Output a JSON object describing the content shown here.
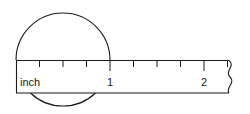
{
  "figure": {
    "background_color": "#ffffff",
    "line_color": "#1a1a1a",
    "width": 250,
    "height": 114
  },
  "ruler": {
    "unit_label": "inch",
    "left_x": 16,
    "top_y": 60,
    "bottom_y": 93,
    "right_x": 232,
    "pixels_per_inch": 47,
    "broken_edge": true,
    "broken_edge_name": "break-squiggle",
    "major_ticks": [
      {
        "value": "0",
        "label": "",
        "x": 16,
        "height": 11
      },
      {
        "value": "1",
        "label": "1",
        "x": 110,
        "height": 11
      },
      {
        "value": "2",
        "label": "2",
        "x": 204,
        "height": 11
      }
    ],
    "minor_ticks": [
      {
        "value": "0.25",
        "x": 39.5,
        "height": 6
      },
      {
        "value": "0.5",
        "x": 63,
        "height": 6
      },
      {
        "value": "0.75",
        "x": 86.5,
        "height": 6
      },
      {
        "value": "1.25",
        "x": 133.5,
        "height": 6
      },
      {
        "value": "1.5",
        "x": 157,
        "height": 6
      },
      {
        "value": "1.75",
        "x": 180.5,
        "height": 6
      },
      {
        "value": "2.25",
        "x": 227.5,
        "height": 6
      }
    ],
    "tick_labels": [
      {
        "text": "1",
        "x": 110,
        "y": 86
      },
      {
        "text": "2",
        "x": 204,
        "y": 86
      }
    ]
  },
  "oval": {
    "name": "measured-oval",
    "center_x": 63,
    "center_y": 57,
    "radius_x": 47,
    "radius_y": 47,
    "measured_length_inches": "1",
    "left_edge_x": 16,
    "right_edge_x": 110,
    "top_edge_y": 10,
    "bottom_edge_y": 104
  }
}
